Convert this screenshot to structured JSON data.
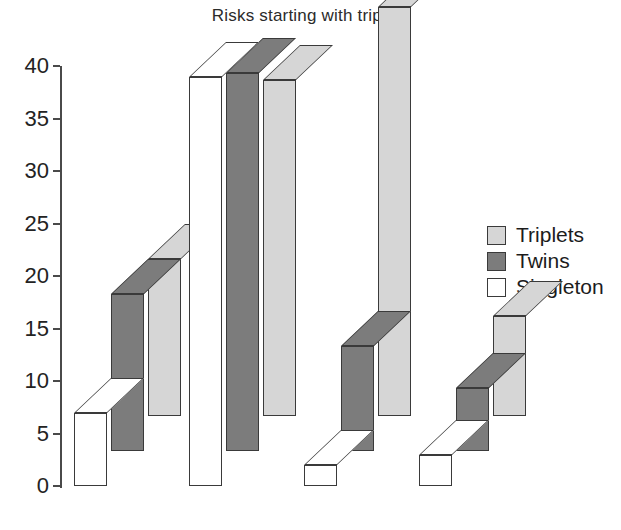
{
  "chart_data": {
    "type": "bar",
    "title": "Risks starting with triplets",
    "xlabel": "",
    "ylabel": "",
    "ylim": [
      0,
      40
    ],
    "yticks": [
      0,
      5,
      10,
      15,
      20,
      25,
      30,
      35,
      40
    ],
    "grid": false,
    "legend_position": "right",
    "three_d": true,
    "categories": [
      "Miscarriage",
      "GA at del",
      "<1500grams",
      "Inf mortality"
    ],
    "series": [
      {
        "name": "Triplets",
        "color": "#d6d6d6",
        "values": [
          15,
          32,
          39,
          9.5
        ]
      },
      {
        "name": "Twins",
        "color": "#7c7c7c",
        "values": [
          15,
          36,
          10,
          6
        ]
      },
      {
        "name": "Singleton",
        "color": "#ffffff",
        "values": [
          7,
          39,
          2,
          3
        ]
      }
    ]
  },
  "legend": {
    "items": [
      {
        "label": "Triplets"
      },
      {
        "label": "Twins"
      },
      {
        "label": "Singleton"
      }
    ]
  },
  "colors": {
    "triplets": "#d6d6d6",
    "twins": "#7c7c7c",
    "singleton": "#ffffff",
    "outline": "#3a3a3a",
    "axis": "#4a4a4a",
    "text": "#1c1c1c",
    "background": "#ffffff"
  }
}
